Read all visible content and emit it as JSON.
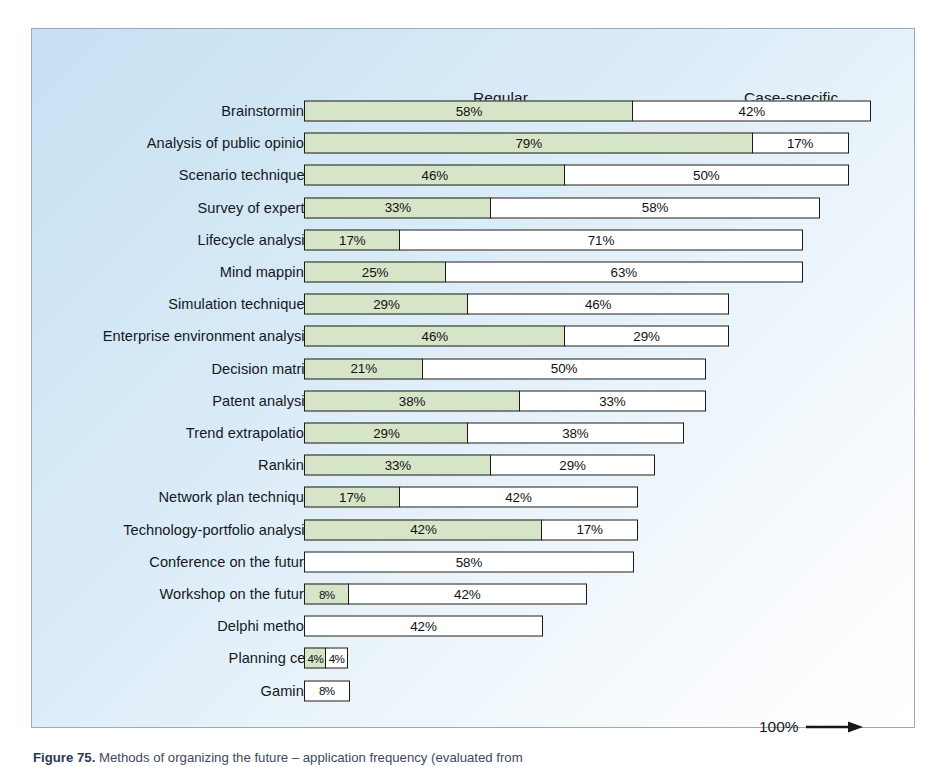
{
  "figure": {
    "caption_label": "Figure 75.",
    "caption_text": "Methods of organizing the future – application frequency (evaluated from"
  },
  "headers": {
    "regular": "Regular",
    "case_specific": "Case-specific"
  },
  "scale": {
    "label": "100%",
    "arrow_icon": "right-arrow-icon"
  },
  "chart_data": {
    "type": "bar",
    "title": "Methods of organizing the future – application frequency",
    "xlabel": "",
    "ylabel": "",
    "xlim": [
      0,
      100
    ],
    "grid": false,
    "legend_position": "top",
    "stacked": true,
    "orientation": "horizontal",
    "units": "%",
    "categories": [
      "Brainstorming",
      "Analysis of public opinion",
      "Scenario techniques",
      "Survey of experts",
      "Lifecycle analysis",
      "Mind mapping",
      "Simulation techniques",
      "Enterprise environment analysis",
      "Decision matrix",
      "Patent analysis",
      "Trend extrapolation",
      "Ranking",
      "Network plan technique",
      "Technology-portfolio analysis",
      "Conference on the future",
      "Workshop on the future",
      "Delphi method",
      "Planning cell",
      "Gaming"
    ],
    "series": [
      {
        "name": "Regular",
        "color": "#d6e4c8",
        "values": [
          58,
          79,
          46,
          33,
          17,
          25,
          29,
          46,
          21,
          38,
          29,
          33,
          17,
          42,
          0,
          8,
          0,
          4,
          0
        ]
      },
      {
        "name": "Case-specific",
        "color": "#ffffff",
        "values": [
          42,
          17,
          50,
          58,
          71,
          63,
          46,
          29,
          50,
          33,
          38,
          29,
          42,
          17,
          58,
          42,
          42,
          4,
          8
        ]
      }
    ]
  },
  "rows": [
    {
      "label": "Brainstorming",
      "regular": 58,
      "regular_text": "58%",
      "case": 42,
      "case_text": "42%"
    },
    {
      "label": "Analysis of public opinion",
      "regular": 79,
      "regular_text": "79%",
      "case": 17,
      "case_text": "17%"
    },
    {
      "label": "Scenario techniques",
      "regular": 46,
      "regular_text": "46%",
      "case": 50,
      "case_text": "50%"
    },
    {
      "label": "Survey of experts",
      "regular": 33,
      "regular_text": "33%",
      "case": 58,
      "case_text": "58%"
    },
    {
      "label": "Lifecycle analysis",
      "regular": 17,
      "regular_text": "17%",
      "case": 71,
      "case_text": "71%"
    },
    {
      "label": "Mind mapping",
      "regular": 25,
      "regular_text": "25%",
      "case": 63,
      "case_text": "63%"
    },
    {
      "label": "Simulation techniques",
      "regular": 29,
      "regular_text": "29%",
      "case": 46,
      "case_text": "46%"
    },
    {
      "label": "Enterprise environment analysis",
      "regular": 46,
      "regular_text": "46%",
      "case": 29,
      "case_text": "29%"
    },
    {
      "label": "Decision matrix",
      "regular": 21,
      "regular_text": "21%",
      "case": 50,
      "case_text": "50%"
    },
    {
      "label": "Patent analysis",
      "regular": 38,
      "regular_text": "38%",
      "case": 33,
      "case_text": "33%"
    },
    {
      "label": "Trend extrapolation",
      "regular": 29,
      "regular_text": "29%",
      "case": 38,
      "case_text": "38%"
    },
    {
      "label": "Ranking",
      "regular": 33,
      "regular_text": "33%",
      "case": 29,
      "case_text": "29%"
    },
    {
      "label": "Network plan technique",
      "regular": 17,
      "regular_text": "17%",
      "case": 42,
      "case_text": "42%"
    },
    {
      "label": "Technology-portfolio analysis",
      "regular": 42,
      "regular_text": "42%",
      "case": 17,
      "case_text": "17%"
    },
    {
      "label": "Conference on the future",
      "regular": 0,
      "regular_text": "",
      "case": 58,
      "case_text": "58%"
    },
    {
      "label": "Workshop on the future",
      "regular": 8,
      "regular_text": "8%",
      "case": 42,
      "case_text": "42%"
    },
    {
      "label": "Delphi method",
      "regular": 0,
      "regular_text": "",
      "case": 42,
      "case_text": "42%"
    },
    {
      "label": "Planning cell",
      "regular": 4,
      "regular_text": "4%",
      "case": 4,
      "case_text": "4%"
    },
    {
      "label": "Gaming",
      "regular": 0,
      "regular_text": "",
      "case": 8,
      "case_text": "8%"
    }
  ]
}
